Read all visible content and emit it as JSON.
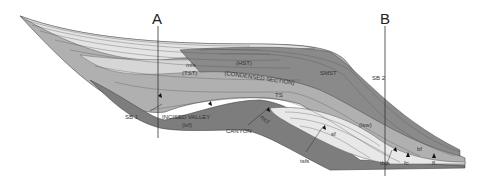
{
  "diagram": {
    "type": "sequence-stratigraphy-cross-section",
    "sections": {
      "A": "A",
      "B": "B"
    },
    "labels": {
      "mfs": "mfs",
      "tst": "(TST)",
      "hst": "(HST)",
      "condensed": "(CONDENSED SECTION)",
      "smst": "SMST",
      "sb2": "SB 2",
      "sb1": "SB 1",
      "ts": "TS",
      "incised_valley": "INCISED VALLEY",
      "ivf": "(ivf)",
      "canyon": "CANYON",
      "mcf": "mcf",
      "lsw": "(lsw)",
      "sf": "sf",
      "tsfs": "tsfs",
      "tbfs": "tbfs",
      "fc": "fc",
      "bf": "bf",
      "fl": "fl"
    },
    "colors": {
      "dark": "#7a7a7a",
      "mid": "#a8a8a8",
      "light": "#cfcfcf",
      "pale": "#e8e8e8",
      "line": "#4a4a4a"
    }
  }
}
